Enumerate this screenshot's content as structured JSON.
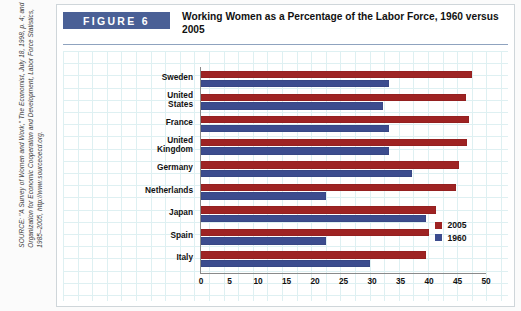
{
  "figure": {
    "tag_label": "FIGURE 6",
    "title": "Working Women as a Percentage of the Labor Force, 1960 versus 2005"
  },
  "source": {
    "text": "SOURCE: \"A Survey of Women and Work,\" The Economist, July 18, 1998, p. 4; and Organization for Economic Cooperation and Development, Labor Force Statistics, 1985–2005, http://www.sourceoecd.org."
  },
  "legend": {
    "position": "inside-right",
    "entries": [
      {
        "label": "2005",
        "color": "#9e2323"
      },
      {
        "label": "1960",
        "color": "#3c4c8e"
      }
    ]
  },
  "axis": {
    "x_ticks": [
      "0",
      "5",
      "10",
      "15",
      "20",
      "25",
      "30",
      "35",
      "40",
      "45",
      "50"
    ]
  },
  "chart_data": {
    "type": "bar",
    "orientation": "horizontal",
    "title": "Working Women as a Percentage of the Labor Force, 1960 versus 2005",
    "xlabel": "",
    "ylabel": "",
    "xlim": [
      0,
      50
    ],
    "xtick_step": 5,
    "grid": true,
    "legend_position": "inside-right",
    "categories": [
      "Sweden",
      "United States",
      "France",
      "United Kingdom",
      "Germany",
      "Netherlands",
      "Japan",
      "Spain",
      "Italy"
    ],
    "series": [
      {
        "name": "2005",
        "color": "#9e2323",
        "values": [
          47.5,
          46.5,
          47.0,
          46.7,
          45.2,
          44.8,
          41.2,
          40.0,
          39.5
        ]
      },
      {
        "name": "1960",
        "color": "#3c4c8e",
        "values": [
          33.0,
          32.0,
          33.0,
          33.0,
          37.0,
          22.0,
          39.5,
          22.0,
          29.7
        ]
      }
    ]
  }
}
